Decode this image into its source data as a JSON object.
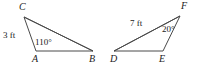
{
  "figure": {
    "kind": "geometry-diagram",
    "canvas": {
      "width": 197,
      "height": 66
    },
    "style": {
      "background_color": "#ffffff",
      "stroke_color": "#4a4a4a",
      "text_color": "#1a1a1a",
      "stroke_width": 1
    },
    "triangles": [
      {
        "name": "triangle-abc",
        "vertices": [
          {
            "id": "C",
            "label": "C",
            "x": 24,
            "y": 17,
            "label_x": 19,
            "label_y": 2
          },
          {
            "id": "A",
            "label": "A",
            "x": 36,
            "y": 51,
            "label_x": 32,
            "label_y": 54
          },
          {
            "id": "B",
            "label": "B",
            "x": 93,
            "y": 51,
            "label_x": 89,
            "label_y": 54
          }
        ],
        "side_labels": [
          {
            "name": "side-ca-length",
            "text": "3 ft",
            "x": 3,
            "y": 31
          }
        ],
        "angle_labels": [
          {
            "name": "angle-a-measure",
            "text": "110°",
            "x": 35,
            "y": 38
          }
        ]
      },
      {
        "name": "triangle-def",
        "vertices": [
          {
            "id": "F",
            "label": "F",
            "x": 180,
            "y": 16,
            "label_x": 181,
            "label_y": 1
          },
          {
            "id": "D",
            "label": "D",
            "x": 114,
            "y": 51,
            "label_x": 110,
            "label_y": 54
          },
          {
            "id": "E",
            "label": "E",
            "x": 163,
            "y": 51,
            "label_x": 159,
            "label_y": 54
          }
        ],
        "side_labels": [
          {
            "name": "side-df-length",
            "text": "7 ft",
            "x": 130,
            "y": 19
          }
        ],
        "angle_labels": [
          {
            "name": "angle-f-measure",
            "text": "20°",
            "x": 162,
            "y": 25
          }
        ]
      }
    ]
  }
}
